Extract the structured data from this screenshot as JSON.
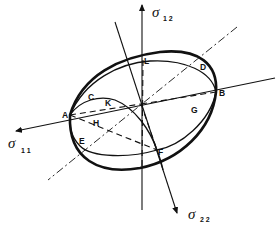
{
  "diagram": {
    "type": "stress-space yield surface sketch",
    "axes": [
      {
        "id": "s11",
        "symbol": "σ",
        "subscript": "1 1"
      },
      {
        "id": "s12",
        "symbol": "σ",
        "subscript": "1 2"
      },
      {
        "id": "s22",
        "symbol": "σ",
        "subscript": "2 2"
      }
    ],
    "points": [
      {
        "id": "A",
        "label": "A"
      },
      {
        "id": "B",
        "label": "B"
      },
      {
        "id": "C",
        "label": "C"
      },
      {
        "id": "D",
        "label": "D"
      },
      {
        "id": "E",
        "label": "E"
      },
      {
        "id": "F",
        "label": "F"
      },
      {
        "id": "G",
        "label": "G"
      },
      {
        "id": "H",
        "label": "H"
      },
      {
        "id": "K",
        "label": "K"
      },
      {
        "id": "L",
        "label": "L"
      }
    ],
    "colors": {
      "ink": "#111111",
      "background": "#ffffff"
    }
  }
}
